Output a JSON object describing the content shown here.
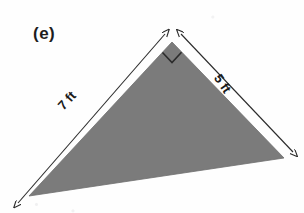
{
  "figure": {
    "part_label": "(e)",
    "shape_name": "right-triangle",
    "fill_color": "#7b7b7b",
    "stroke_color": "#2b2b2b",
    "background_color": "#fefefe",
    "right_angle_marker": true,
    "vertices": {
      "apex": [
        172,
        42
      ],
      "bottom_left": [
        29,
        196
      ],
      "bottom_right": [
        284,
        158
      ]
    },
    "dimensions": [
      {
        "name": "left-leg",
        "label": "7 ft",
        "value": 7,
        "unit": "ft",
        "rotation_deg": -47
      },
      {
        "name": "right-leg",
        "label": "5 ft",
        "value": 5,
        "unit": "ft",
        "rotation_deg": 56
      }
    ],
    "arrow_geometry": {
      "left_arrow": {
        "x1": 18,
        "y1": 203,
        "x2": 165,
        "y2": 34
      },
      "right_arrow": {
        "x1": 181,
        "y1": 34,
        "x2": 293,
        "y2": 152
      }
    }
  }
}
